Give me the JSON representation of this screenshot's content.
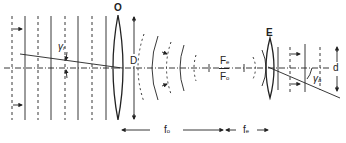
{
  "diagram": {
    "labels": {
      "objective": "O",
      "eyepiece": "E",
      "aperture": "D",
      "exit_pupil": "d",
      "focal_e": "F",
      "focal_e_sub": "e",
      "focal_o": "F",
      "focal_o_sub": "o",
      "gamma_r": "γ",
      "gamma_r_sub": "r",
      "gamma_a": "γ",
      "gamma_a_sub": "a",
      "fo": "f",
      "fo_sub": "o",
      "fe": "f",
      "fe_sub": "e"
    },
    "colors": {
      "stroke": "#222222",
      "background": "#ffffff"
    }
  }
}
